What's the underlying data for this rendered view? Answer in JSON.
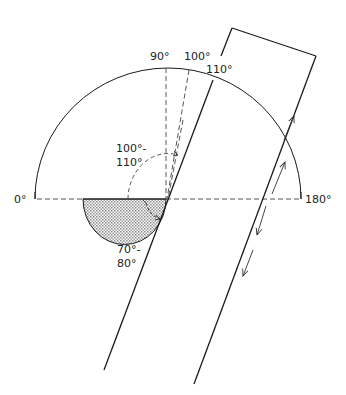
{
  "diagram": {
    "type": "protractor-angle-diagram",
    "labels": {
      "deg0": "0°",
      "deg180": "180°",
      "deg90": "90°",
      "deg100": "100°",
      "deg110": "110°",
      "upper_range_line1": "100°-",
      "upper_range_line2": "110°",
      "lower_range_line1": "70°-",
      "lower_range_line2": "80°"
    },
    "colors": {
      "stroke": "#1a1a1a",
      "dash": "#555555",
      "shade": "#bdbdbd"
    }
  }
}
